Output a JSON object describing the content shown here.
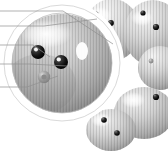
{
  "figure": {
    "name": "microscopy-figure",
    "background_color": "#ffffff",
    "partial_label_text": "g",
    "magnifier": {
      "name": "magnification-callout",
      "center_x": 62,
      "center_y": 63,
      "radius": 57,
      "stroke_color": "#c9c9c9"
    },
    "leader_lines": [
      {
        "name": "leader-line-1",
        "y": 11,
        "x_start": 0,
        "x_elbow": 63,
        "x_end": 113,
        "y_end": 44
      },
      {
        "name": "leader-line-2",
        "y": 26,
        "x_start": 0,
        "x_elbow": 44,
        "x_end": 96,
        "y_end": 19
      },
      {
        "name": "leader-line-3",
        "y": 45,
        "x_start": 0,
        "x_elbow": 33,
        "x_end": 50,
        "y_end": 57
      },
      {
        "name": "leader-line-4",
        "y": 64,
        "x_start": 0,
        "x_elbow": 30,
        "x_end": 67,
        "y_end": 66
      },
      {
        "name": "leader-line-5",
        "y": 87,
        "x_start": 0,
        "x_elbow": 27,
        "x_end": 58,
        "y_end": 76
      }
    ],
    "grains": [
      {
        "name": "grain-main-magnified",
        "cx": 62,
        "cy": 64,
        "rx": 52,
        "ry": 49,
        "tone": "#b5b5b5"
      },
      {
        "name": "grain-upper-middle",
        "cx": 112,
        "cy": 30,
        "rx": 28,
        "ry": 30,
        "tone": "#d2d2d2"
      },
      {
        "name": "grain-upper-right",
        "cx": 152,
        "cy": 32,
        "rx": 28,
        "ry": 31,
        "tone": "#c6c6c6"
      },
      {
        "name": "grain-lower-right",
        "cx": 143,
        "cy": 113,
        "rx": 28,
        "ry": 24,
        "tone": "#c3c3c3"
      },
      {
        "name": "grain-lower-left-small",
        "cx": 111,
        "cy": 130,
        "rx": 24,
        "ry": 20,
        "tone": "#c9c9c9"
      }
    ],
    "papillae": [
      {
        "name": "papilla-dark-left",
        "cx": 38,
        "cy": 52,
        "r": 6.5,
        "color": "#1d1d1d"
      },
      {
        "name": "papilla-dark-center",
        "cx": 60,
        "cy": 62,
        "r": 6.5,
        "color": "#141414"
      },
      {
        "name": "papilla-gray-lower",
        "cx": 44,
        "cy": 76,
        "r": 6.0,
        "color": "#9a9a9a"
      },
      {
        "name": "papilla-upper-middle-a",
        "cx": 96,
        "cy": 14,
        "r": 2.6,
        "color": "#2a2a2a"
      },
      {
        "name": "papilla-upper-middle-b",
        "cx": 111,
        "cy": 23,
        "r": 2.8,
        "color": "#222222"
      },
      {
        "name": "papilla-upper-right-a",
        "cx": 143,
        "cy": 13,
        "r": 2.6,
        "color": "#2a2a2a"
      },
      {
        "name": "papilla-upper-right-b",
        "cx": 155,
        "cy": 26,
        "r": 3.0,
        "color": "#1f1f1f"
      },
      {
        "name": "papilla-upper-right-c",
        "cx": 152,
        "cy": 61,
        "r": 2.4,
        "color": "#3a3a3a"
      },
      {
        "name": "papilla-lower-right-a",
        "cx": 155,
        "cy": 97,
        "r": 3.0,
        "color": "#1f1f1f"
      },
      {
        "name": "papilla-lower-left-a",
        "cx": 104,
        "cy": 120,
        "r": 2.8,
        "color": "#242424"
      },
      {
        "name": "papilla-lower-left-b",
        "cx": 117,
        "cy": 133,
        "r": 2.8,
        "color": "#1f1f1f"
      }
    ],
    "highlights": [
      {
        "name": "specular-highlight-main",
        "cx": 82,
        "cy": 51,
        "rx": 6,
        "ry": 9,
        "color": "#ffffff"
      }
    ]
  }
}
